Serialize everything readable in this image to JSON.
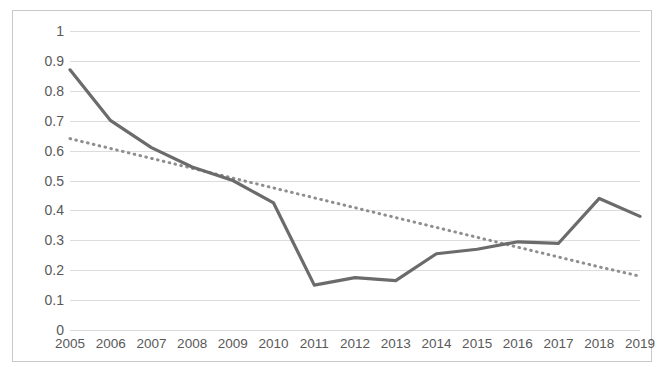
{
  "chart_data": {
    "type": "line",
    "title": "",
    "subtitle": "",
    "xlabel": "",
    "ylabel": "",
    "categories": [
      "2005",
      "2006",
      "2007",
      "2008",
      "2009",
      "2010",
      "2011",
      "2012",
      "2013",
      "2014",
      "2015",
      "2016",
      "2017",
      "2018",
      "2019"
    ],
    "series": [
      {
        "name": "data",
        "style": "solid",
        "color": "#6b6b6b",
        "values": [
          0.87,
          0.7,
          0.61,
          0.545,
          0.5,
          0.425,
          0.15,
          0.175,
          0.165,
          0.255,
          0.27,
          0.295,
          0.29,
          0.44,
          0.38
        ]
      },
      {
        "name": "trendline",
        "style": "dotted",
        "color": "#8e8e8e",
        "values": [
          0.64,
          0.607,
          0.574,
          0.541,
          0.508,
          0.475,
          0.442,
          0.409,
          0.376,
          0.343,
          0.31,
          0.277,
          0.244,
          0.211,
          0.18
        ]
      }
    ],
    "ylim": [
      0,
      1
    ],
    "ytick_step": 0.1,
    "yticks": [
      "1",
      "0.9",
      "0.8",
      "0.7",
      "0.6",
      "0.5",
      "0.4",
      "0.3",
      "0.2",
      "0.1",
      "0"
    ],
    "ytick_values": [
      1,
      0.9,
      0.8,
      0.7,
      0.6,
      0.5,
      0.4,
      0.3,
      0.2,
      0.1,
      0
    ],
    "grid": "horizontal",
    "grid_color": "#dcdcdc",
    "legend": "none",
    "legend_position": "none",
    "border_color": "#c9c9c9",
    "background": "#ffffff",
    "axis_label_color": "#595959"
  }
}
